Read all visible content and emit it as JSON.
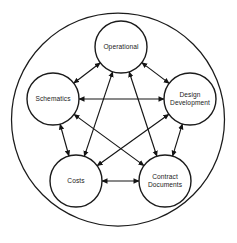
{
  "diagram": {
    "type": "network-pentagram",
    "background_color": "#ffffff",
    "stroke_color": "#1b1b1b",
    "text_color": "#1a1a1a",
    "canvas": {
      "width": 237,
      "height": 243
    },
    "outer_circle": {
      "name": "outer-boundary-circle",
      "cx": 118,
      "cy": 119.5,
      "r": 106.5
    },
    "node_radius": 26,
    "nodes": [
      {
        "id": "operational",
        "label": "Operational",
        "lines": [
          "Operational"
        ],
        "cx": 121,
        "cy": 47
      },
      {
        "id": "design-development",
        "label": "Design Development",
        "lines": [
          "Design",
          "Development"
        ],
        "cx": 190,
        "cy": 99
      },
      {
        "id": "contract-documents",
        "label": "Contract Documents",
        "lines": [
          "Contract",
          "Documents"
        ],
        "cx": 165,
        "cy": 181
      },
      {
        "id": "costs",
        "label": "Costs",
        "lines": [
          "Costs"
        ],
        "cx": 76,
        "cy": 181
      },
      {
        "id": "schematics",
        "label": "Schematics",
        "lines": [
          "Schematics"
        ],
        "cx": 53,
        "cy": 99
      }
    ],
    "links": [
      {
        "from": "operational",
        "to": "design-development",
        "arrows": "both"
      },
      {
        "from": "operational",
        "to": "contract-documents",
        "arrows": "both"
      },
      {
        "from": "operational",
        "to": "costs",
        "arrows": "both"
      },
      {
        "from": "operational",
        "to": "schematics",
        "arrows": "both"
      },
      {
        "from": "design-development",
        "to": "contract-documents",
        "arrows": "both"
      },
      {
        "from": "design-development",
        "to": "costs",
        "arrows": "both"
      },
      {
        "from": "design-development",
        "to": "schematics",
        "arrows": "both"
      },
      {
        "from": "contract-documents",
        "to": "costs",
        "arrows": "both"
      },
      {
        "from": "contract-documents",
        "to": "schematics",
        "arrows": "both"
      },
      {
        "from": "costs",
        "to": "schematics",
        "arrows": "both"
      }
    ]
  }
}
